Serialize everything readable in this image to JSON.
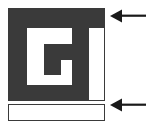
{
  "figure": {
    "kind": "diagram",
    "width": 148,
    "height": 129,
    "background_color": "#ffffff",
    "glyph": {
      "name": "spiral-maze-glyph",
      "description": "stylized square spiral resembling letter G",
      "fill_color": "#3a3a3a",
      "outline_color": "#3a3a3a",
      "parts": [
        {
          "name": "top-bar",
          "label": ""
        },
        {
          "name": "left-stroke",
          "label": ""
        },
        {
          "name": "bottom-stroke",
          "label": ""
        },
        {
          "name": "right-stroke",
          "label": ""
        },
        {
          "name": "inner-hook",
          "label": ""
        }
      ]
    },
    "bottom_bar": {
      "name": "bottom-bar",
      "fill_color": "#ffffff",
      "border_color": "#3a3a3a",
      "label": ""
    },
    "annotations": [
      {
        "name": "arrow-top",
        "icon": "arrow-left-icon",
        "direction": "left",
        "color": "#1a1a1a",
        "label": "",
        "points_to": "top-bar"
      },
      {
        "name": "arrow-bottom",
        "icon": "arrow-left-icon",
        "direction": "left",
        "color": "#1a1a1a",
        "label": "",
        "points_to": "bottom-bar"
      }
    ]
  }
}
